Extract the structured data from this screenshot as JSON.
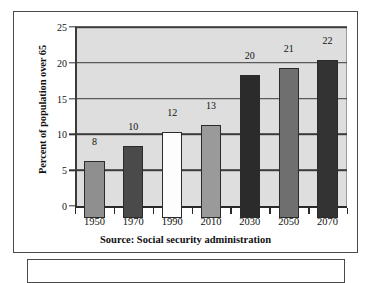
{
  "figure": {
    "source_caption": "Source: Social security administration",
    "lower_box_content": ""
  },
  "chart_data": {
    "type": "bar",
    "title": "",
    "xlabel": "",
    "ylabel": "Percent of population over 65",
    "categories": [
      "1950",
      "1970",
      "1990",
      "2010",
      "2030",
      "2050",
      "2070"
    ],
    "values": [
      8,
      10,
      12,
      13,
      20,
      21,
      22
    ],
    "bar_colors": [
      "#8f8f8f",
      "#4a4a4a",
      "#fdfdfd",
      "#9a9a9a",
      "#2b2b2b",
      "#6f6f6f",
      "#333333"
    ],
    "data_labels": [
      "8",
      "10",
      "12",
      "13",
      "20",
      "21",
      "22"
    ],
    "ylim": [
      0,
      25
    ],
    "ytick_labels": [
      "0",
      "5",
      "10",
      "15",
      "20",
      "25"
    ],
    "ytick_values": [
      0,
      5,
      10,
      15,
      20,
      25
    ],
    "grid": true,
    "grid_axis": "y",
    "legend": false,
    "plot_background": "#dedede",
    "axis_color": "#3a3a3a"
  }
}
